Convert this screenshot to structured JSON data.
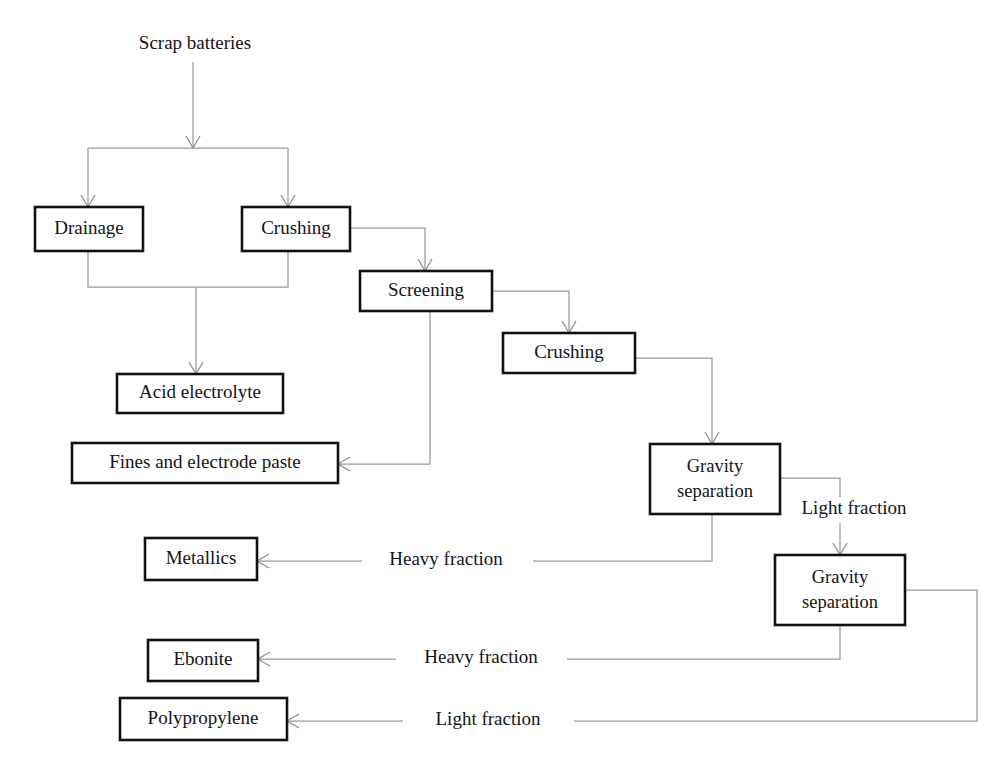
{
  "diagram": {
    "background_color": "#ffffff",
    "box_stroke_color": "#111111",
    "edge_color": "#9a9a9a",
    "text_color": "#141414",
    "entry_label": "Scrap batteries",
    "nodes": [
      {
        "id": "drainage",
        "label": "Drainage",
        "x": 35,
        "y": 207,
        "w": 108,
        "h": 44
      },
      {
        "id": "crushing1",
        "label": "Crushing",
        "x": 242,
        "y": 207,
        "w": 108,
        "h": 44
      },
      {
        "id": "screening",
        "label": "Screening",
        "x": 360,
        "y": 271,
        "w": 132,
        "h": 40
      },
      {
        "id": "crushing2",
        "label": "Crushing",
        "x": 503,
        "y": 333,
        "w": 132,
        "h": 40
      },
      {
        "id": "acid",
        "label": "Acid electrolyte",
        "x": 117,
        "y": 374,
        "w": 166,
        "h": 39
      },
      {
        "id": "fines",
        "label": "Fines and electrode paste",
        "x": 72,
        "y": 443,
        "w": 266,
        "h": 40
      },
      {
        "id": "gravity1",
        "label": "Gravity separation",
        "line1": "Gravity",
        "line2": "separation",
        "x": 650,
        "y": 444,
        "w": 130,
        "h": 70
      },
      {
        "id": "gravity2",
        "label": "Gravity separation",
        "line1": "Gravity",
        "line2": "separation",
        "x": 775,
        "y": 555,
        "w": 130,
        "h": 70
      },
      {
        "id": "metallics",
        "label": "Metallics",
        "x": 145,
        "y": 538,
        "w": 112,
        "h": 42
      },
      {
        "id": "ebonite",
        "label": "Ebonite",
        "x": 148,
        "y": 640,
        "w": 110,
        "h": 41
      },
      {
        "id": "polypropylene",
        "label": "Polypropylene",
        "x": 120,
        "y": 698,
        "w": 167,
        "h": 42
      }
    ],
    "edge_labels": [
      {
        "id": "light-fraction-1",
        "text": "Light fraction",
        "x": 854,
        "y": 510
      },
      {
        "id": "heavy-fraction-1",
        "text": "Heavy fraction",
        "x": 446,
        "y": 561
      },
      {
        "id": "heavy-fraction-2",
        "text": "Heavy fraction",
        "x": 481,
        "y": 659
      },
      {
        "id": "light-fraction-2",
        "text": "Light fraction",
        "x": 488,
        "y": 721
      }
    ],
    "edges": [
      {
        "id": "entry-to-split",
        "from": "Scrap batteries",
        "to": "split-bar"
      },
      {
        "id": "split-to-drainage",
        "from": "split-bar",
        "to": "drainage"
      },
      {
        "id": "split-to-crushing1",
        "from": "split-bar",
        "to": "crushing1"
      },
      {
        "id": "drainage-to-acid",
        "from": "drainage",
        "to": "acid"
      },
      {
        "id": "crushing1-to-acid",
        "from": "crushing1",
        "to": "acid"
      },
      {
        "id": "crushing1-to-screening",
        "from": "crushing1",
        "to": "screening"
      },
      {
        "id": "screening-to-fines",
        "from": "screening",
        "to": "fines"
      },
      {
        "id": "screening-to-crushing2",
        "from": "screening",
        "to": "crushing2"
      },
      {
        "id": "crushing2-to-gravity1",
        "from": "crushing2",
        "to": "gravity1"
      },
      {
        "id": "gravity1-to-metallics",
        "from": "gravity1",
        "to": "metallics",
        "label": "Heavy fraction"
      },
      {
        "id": "gravity1-to-gravity2",
        "from": "gravity1",
        "to": "gravity2",
        "label": "Light fraction"
      },
      {
        "id": "gravity2-to-ebonite",
        "from": "gravity2",
        "to": "ebonite",
        "label": "Heavy fraction"
      },
      {
        "id": "gravity2-to-polypropylene",
        "from": "gravity2",
        "to": "polypropylene",
        "label": "Light fraction"
      }
    ]
  }
}
